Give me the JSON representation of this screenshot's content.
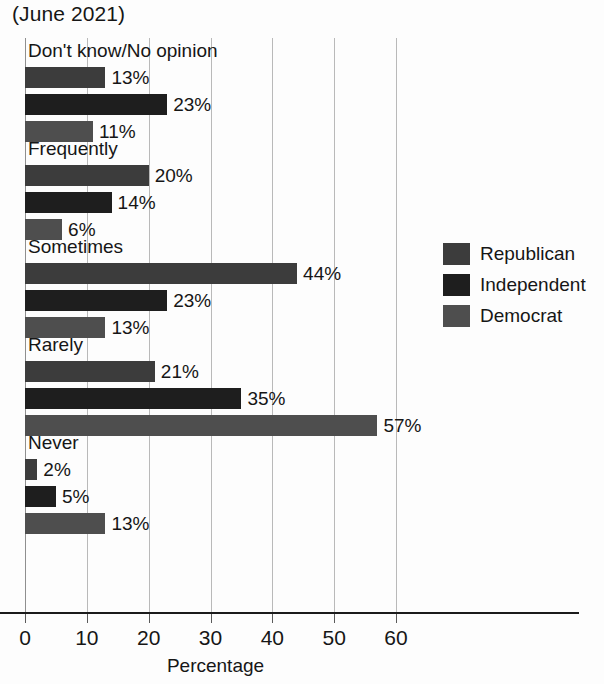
{
  "chart_data": {
    "type": "bar",
    "orientation": "horizontal",
    "title": "(June 2021)",
    "xlabel": "Percentage",
    "ylabel": "",
    "xlim": [
      0,
      60
    ],
    "xticks": [
      0,
      10,
      20,
      30,
      40,
      50,
      60
    ],
    "xtick_labels": [
      "0",
      "10",
      "20",
      "30",
      "40",
      "50",
      "60"
    ],
    "grid": true,
    "grid_axis": "x",
    "legend_position": "right",
    "categories": [
      "Don't know/No opinion",
      "Frequently",
      "Sometimes",
      "Rarely",
      "Never"
    ],
    "series": [
      {
        "name": "Republican",
        "color": "#3c3c3c",
        "values": [
          13,
          20,
          44,
          21,
          2
        ],
        "labels": [
          "13%",
          "20%",
          "44%",
          "21%",
          "2%"
        ]
      },
      {
        "name": "Independent",
        "color": "#1e1e1e",
        "values": [
          23,
          14,
          23,
          35,
          5
        ],
        "labels": [
          "23%",
          "14%",
          "23%",
          "35%",
          "5%"
        ]
      },
      {
        "name": "Democrat",
        "color": "#4e4e4e",
        "values": [
          11,
          6,
          13,
          57,
          13
        ],
        "labels": [
          "11%",
          "6%",
          "13%",
          "57%",
          "13%"
        ]
      }
    ],
    "groups": [
      {
        "label": "Don't know/No opinion",
        "bars": [
          {
            "series": "Republican",
            "value": 13,
            "label": "13%"
          },
          {
            "series": "Independent",
            "value": 23,
            "label": "23%"
          },
          {
            "series": "Democrat",
            "value": 11,
            "label": "11%"
          }
        ]
      },
      {
        "label": "Frequently",
        "bars": [
          {
            "series": "Republican",
            "value": 20,
            "label": "20%"
          },
          {
            "series": "Independent",
            "value": 14,
            "label": "14%"
          },
          {
            "series": "Democrat",
            "value": 6,
            "label": "6%"
          }
        ]
      },
      {
        "label": "Sometimes",
        "bars": [
          {
            "series": "Republican",
            "value": 44,
            "label": "44%"
          },
          {
            "series": "Independent",
            "value": 23,
            "label": "23%"
          },
          {
            "series": "Democrat",
            "value": 13,
            "label": "13%"
          }
        ]
      },
      {
        "label": "Rarely",
        "bars": [
          {
            "series": "Republican",
            "value": 21,
            "label": "21%"
          },
          {
            "series": "Independent",
            "value": 35,
            "label": "35%"
          },
          {
            "series": "Democrat",
            "value": 57,
            "label": "57%"
          }
        ]
      },
      {
        "label": "Never",
        "bars": [
          {
            "series": "Republican",
            "value": 2,
            "label": "2%"
          },
          {
            "series": "Independent",
            "value": 5,
            "label": "5%"
          },
          {
            "series": "Democrat",
            "value": 13,
            "label": "13%"
          }
        ]
      }
    ]
  },
  "legend": {
    "items": [
      {
        "label": "Republican",
        "color": "#3c3c3c"
      },
      {
        "label": "Independent",
        "color": "#1e1e1e"
      },
      {
        "label": "Democrat",
        "color": "#4e4e4e"
      }
    ]
  },
  "colors": {
    "background": "#fdfdfd",
    "text": "#161616",
    "gridline": "#b9b9b9",
    "axis": "#1b1b1b",
    "republican": "#3c3c3c",
    "independent": "#1e1e1e",
    "democrat": "#4e4e4e"
  }
}
